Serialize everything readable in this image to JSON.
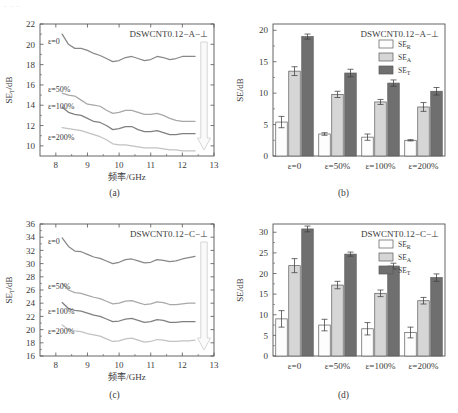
{
  "figure": {
    "top_strip_text": "· · ·",
    "captions": {
      "a": "(a)",
      "b": "(b)",
      "c": "(c)",
      "d": "(d)"
    }
  },
  "common": {
    "xlabel": "频率/GHz",
    "ylabel_line": "SE",
    "ylabel_line_sub": "T",
    "ylabel_line_unit": "/dB",
    "ylabel_bar": "SE",
    "ylabel_bar_unit": "/dB",
    "strain_labels": [
      "ε=0",
      "ε=50%",
      "ε=100%",
      "ε=200%"
    ],
    "legend": [
      {
        "name": "SE",
        "sub": "R",
        "color": "#fdfdfd"
      },
      {
        "name": "SE",
        "sub": "A",
        "color": "#d6d6d6"
      },
      {
        "name": "SE",
        "sub": "T",
        "color": "#6f6f6f"
      }
    ],
    "arrow_note": "decreasing-with-strain"
  },
  "chart_data": [
    {
      "panel": "a",
      "type": "line",
      "title": "DSWCNT0.12−A−⊥",
      "xlabel": "频率/GHz",
      "ylabel": "SE_T /dB",
      "xlim": [
        7.5,
        13
      ],
      "ylim": [
        9,
        22
      ],
      "xticks": [
        8,
        9,
        10,
        11,
        12,
        13
      ],
      "yticks": [
        10,
        12,
        14,
        16,
        18,
        20,
        22
      ],
      "grid": false,
      "legend_position": "inline-curve-labels",
      "series": [
        {
          "name": "ε=0",
          "color": "#888888",
          "x": [
            8.2,
            8.4,
            8.6,
            8.8,
            9.0,
            9.2,
            9.4,
            9.6,
            9.8,
            10.0,
            10.2,
            10.4,
            10.6,
            10.8,
            11.0,
            11.2,
            11.4,
            11.6,
            11.8,
            12.0,
            12.2,
            12.4
          ],
          "values": [
            21.0,
            20.0,
            19.6,
            19.6,
            19.4,
            19.1,
            18.9,
            18.6,
            18.3,
            18.4,
            18.7,
            18.8,
            18.6,
            18.4,
            18.5,
            18.8,
            18.7,
            18.5,
            18.6,
            18.8,
            18.8,
            18.8
          ]
        },
        {
          "name": "ε=50%",
          "color": "#a8a8a8",
          "x": [
            8.2,
            8.4,
            8.6,
            8.8,
            9.0,
            9.2,
            9.4,
            9.6,
            9.8,
            10.0,
            10.2,
            10.4,
            10.6,
            10.8,
            11.0,
            11.2,
            11.4,
            11.6,
            11.8,
            12.0,
            12.2,
            12.4
          ],
          "values": [
            15.2,
            15.0,
            14.9,
            14.5,
            14.1,
            14.0,
            13.9,
            13.5,
            13.2,
            13.3,
            13.5,
            13.5,
            13.3,
            13.1,
            13.1,
            13.2,
            13.0,
            12.7,
            12.5,
            12.4,
            12.4,
            12.4
          ]
        },
        {
          "name": "ε=100%",
          "color": "#808080",
          "x": [
            8.2,
            8.4,
            8.6,
            8.8,
            9.0,
            9.2,
            9.4,
            9.6,
            9.8,
            10.0,
            10.2,
            10.4,
            10.6,
            10.8,
            11.0,
            11.2,
            11.4,
            11.6,
            11.8,
            12.0,
            12.2,
            12.4
          ],
          "values": [
            13.8,
            13.3,
            13.1,
            13.0,
            12.7,
            12.4,
            12.3,
            12.0,
            11.6,
            11.7,
            11.9,
            11.9,
            11.6,
            11.4,
            11.4,
            11.5,
            11.3,
            11.1,
            11.1,
            11.2,
            11.2,
            11.2
          ]
        },
        {
          "name": "ε=200%",
          "color": "#c2c2c2",
          "x": [
            8.2,
            8.4,
            8.6,
            8.8,
            9.0,
            9.2,
            9.4,
            9.6,
            9.8,
            10.0,
            10.2,
            10.4,
            10.6,
            10.8,
            11.0,
            11.2,
            11.4,
            11.6,
            11.8,
            12.0,
            12.2,
            12.4
          ],
          "values": [
            11.8,
            11.7,
            11.6,
            11.5,
            11.3,
            11.1,
            10.9,
            10.6,
            10.2,
            10.1,
            10.1,
            10.0,
            9.9,
            9.8,
            9.8,
            9.8,
            9.7,
            9.6,
            9.6,
            9.5,
            9.5,
            9.5
          ]
        }
      ]
    },
    {
      "panel": "b",
      "type": "bar",
      "title": "DSWCNT0.12−A−⊥",
      "xlabel": "",
      "ylabel": "SE/dB",
      "ylim": [
        0,
        21
      ],
      "yticks": [
        0,
        5,
        10,
        15,
        20
      ],
      "grid": false,
      "legend_position": "top-right",
      "categories": [
        "ε=0",
        "ε=50%",
        "ε=100%",
        "ε=200%"
      ],
      "series": [
        {
          "name": "SE_R",
          "color": "#fdfdfd",
          "values": [
            5.4,
            3.5,
            3.0,
            2.5
          ],
          "errors": [
            0.9,
            0.2,
            0.5,
            0.1
          ]
        },
        {
          "name": "SE_A",
          "color": "#d6d6d6",
          "values": [
            13.5,
            9.8,
            8.6,
            7.8
          ],
          "errors": [
            0.7,
            0.5,
            0.4,
            0.7
          ]
        },
        {
          "name": "SE_T",
          "color": "#6f6f6f",
          "values": [
            19.0,
            13.2,
            11.6,
            10.3
          ],
          "errors": [
            0.4,
            0.6,
            0.5,
            0.6
          ]
        }
      ]
    },
    {
      "panel": "c",
      "type": "line",
      "title": "DSWCNT0.12−C−⊥",
      "xlabel": "频率/GHz",
      "ylabel": "SE_T /dB",
      "xlim": [
        7.5,
        13
      ],
      "ylim": [
        16,
        36
      ],
      "xticks": [
        8,
        9,
        10,
        11,
        12,
        13
      ],
      "yticks": [
        16,
        18,
        20,
        22,
        24,
        26,
        28,
        30,
        32,
        34,
        36
      ],
      "grid": false,
      "legend_position": "inline-curve-labels",
      "series": [
        {
          "name": "ε=0",
          "color": "#888888",
          "x": [
            8.2,
            8.4,
            8.6,
            8.8,
            9.0,
            9.2,
            9.4,
            9.6,
            9.8,
            10.0,
            10.2,
            10.4,
            10.6,
            10.8,
            11.0,
            11.2,
            11.4,
            11.6,
            11.8,
            12.0,
            12.2,
            12.4
          ],
          "values": [
            33.9,
            32.6,
            31.9,
            31.8,
            31.4,
            31.0,
            30.8,
            30.4,
            30.0,
            30.2,
            30.6,
            30.7,
            30.4,
            30.1,
            30.2,
            30.6,
            30.5,
            30.3,
            30.4,
            30.7,
            30.9,
            31.1
          ]
        },
        {
          "name": "ε=50%",
          "color": "#a8a8a8",
          "x": [
            8.2,
            8.4,
            8.6,
            8.8,
            9.0,
            9.2,
            9.4,
            9.6,
            9.8,
            10.0,
            10.2,
            10.4,
            10.6,
            10.8,
            11.0,
            11.2,
            11.4,
            11.6,
            11.8,
            12.0,
            12.2,
            12.4
          ],
          "values": [
            27.0,
            26.0,
            25.6,
            25.5,
            25.2,
            24.9,
            24.7,
            24.3,
            23.9,
            24.0,
            24.3,
            24.4,
            24.1,
            23.8,
            23.9,
            24.2,
            24.1,
            23.8,
            23.8,
            23.9,
            24.0,
            24.0
          ]
        },
        {
          "name": "ε=100%",
          "color": "#808080",
          "x": [
            8.2,
            8.4,
            8.6,
            8.8,
            9.0,
            9.2,
            9.4,
            9.6,
            9.8,
            10.0,
            10.2,
            10.4,
            10.6,
            10.8,
            11.0,
            11.2,
            11.4,
            11.6,
            11.8,
            12.0,
            12.2,
            12.4
          ],
          "values": [
            24.1,
            23.2,
            22.9,
            22.8,
            22.5,
            22.2,
            22.0,
            21.6,
            21.2,
            21.3,
            21.6,
            21.7,
            21.4,
            21.1,
            21.2,
            21.5,
            21.4,
            21.1,
            21.1,
            21.2,
            21.2,
            21.2
          ]
        },
        {
          "name": "ε=200%",
          "color": "#c2c2c2",
          "x": [
            8.2,
            8.4,
            8.6,
            8.8,
            9.0,
            9.2,
            9.4,
            9.6,
            9.8,
            10.0,
            10.2,
            10.4,
            10.6,
            10.8,
            11.0,
            11.2,
            11.4,
            11.6,
            11.8,
            12.0,
            12.2,
            12.4
          ],
          "values": [
            20.7,
            20.0,
            19.8,
            19.7,
            19.4,
            19.2,
            19.0,
            18.6,
            18.2,
            18.3,
            18.6,
            18.7,
            18.4,
            18.1,
            18.2,
            18.5,
            18.4,
            18.2,
            18.2,
            18.3,
            18.3,
            18.4
          ]
        }
      ]
    },
    {
      "panel": "d",
      "type": "bar",
      "title": "DSWCNT0.12−C−⊥",
      "xlabel": "",
      "ylabel": "SE/dB",
      "ylim": [
        0,
        32
      ],
      "yticks": [
        0,
        5,
        10,
        15,
        20,
        25,
        30
      ],
      "grid": false,
      "legend_position": "top-right",
      "categories": [
        "ε=0",
        "ε=50%",
        "ε=100%",
        "ε=200%"
      ],
      "series": [
        {
          "name": "SE_R",
          "color": "#fdfdfd",
          "values": [
            9.0,
            7.5,
            6.6,
            5.7
          ],
          "errors": [
            2.0,
            1.4,
            1.5,
            1.3
          ]
        },
        {
          "name": "SE_A",
          "color": "#d6d6d6",
          "values": [
            21.9,
            17.2,
            15.2,
            13.4
          ],
          "errors": [
            1.7,
            0.9,
            0.8,
            0.8
          ]
        },
        {
          "name": "SE_T",
          "color": "#6f6f6f",
          "values": [
            30.8,
            24.7,
            21.8,
            19.0
          ],
          "errors": [
            0.7,
            0.5,
            0.7,
            0.9
          ]
        }
      ]
    }
  ]
}
